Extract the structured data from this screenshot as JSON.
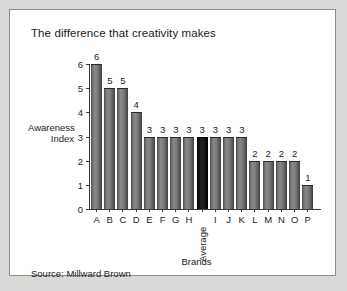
{
  "panel": {
    "title": "The difference that creativity makes",
    "source": "Source: Millward Brown"
  },
  "colors": {
    "page_background": "#d9d9d7",
    "panel_background": "#ffffff",
    "panel_border": "#8d8d8d",
    "bar": "#7b7b7b",
    "bar_highlight": "#000000",
    "axis": "#3a3a3a",
    "text": "#1b1b1b"
  },
  "chart_data": {
    "type": "bar",
    "title": "The difference that creativity makes",
    "xlabel": "Brands",
    "ylabel": "Awareness Index",
    "ylabel_lines": [
      "Awareness",
      "Index"
    ],
    "ylim": [
      0,
      6
    ],
    "yticks": [
      0,
      1,
      2,
      3,
      4,
      5,
      6
    ],
    "ytick_labels": [
      "0",
      "1",
      "2",
      "3",
      "4",
      "5",
      "6"
    ],
    "grid": false,
    "legend": null,
    "data_labels": true,
    "categories": [
      "A",
      "B",
      "C",
      "D",
      "E",
      "F",
      "G",
      "H",
      "Average",
      "I",
      "J",
      "K",
      "L",
      "M",
      "N",
      "O",
      "P"
    ],
    "values": [
      6,
      5,
      5,
      4,
      3,
      3,
      3,
      3,
      3,
      3,
      3,
      3,
      2,
      2,
      2,
      2,
      1
    ],
    "highlight_category": "Average",
    "highlight_index": 8,
    "rotated_labels": [
      "Average"
    ],
    "source": "Source: Millward Brown"
  }
}
